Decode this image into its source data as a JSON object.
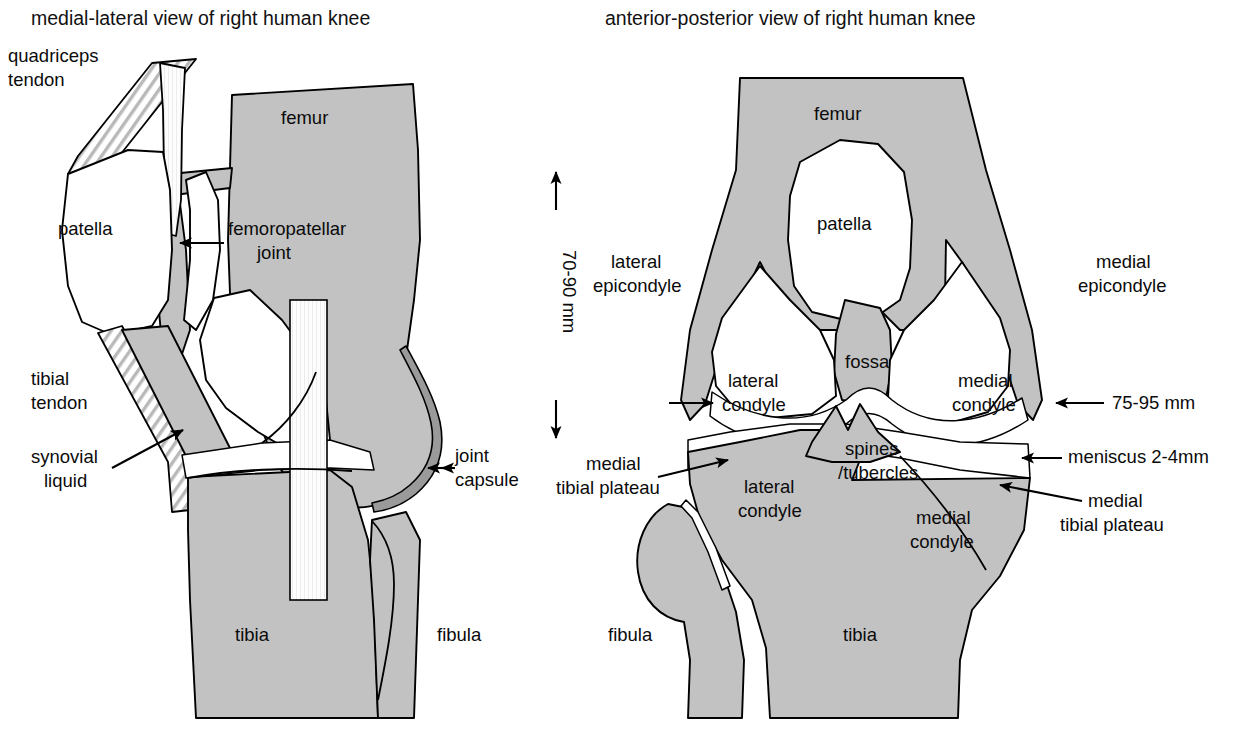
{
  "figure": {
    "kind": "anatomical-diagram",
    "background_color": "#ffffff",
    "bone_fill_color": "#c2c2c2",
    "outline_color": "#000000",
    "cartilage_fill_color": "#ffffff"
  },
  "left_panel": {
    "title": "medial-lateral view of right human knee",
    "labels": {
      "quadriceps_tendon": "quadriceps\ntendon",
      "quadriceps_tendon_line1": "quadriceps",
      "quadriceps_tendon_line2": "tendon",
      "patella": "patella",
      "femur": "femur",
      "femoropatellar_joint_line1": "femoropatellar",
      "femoropatellar_joint_line2": "joint",
      "tibial_tendon_line1": "tibial",
      "tibial_tendon_line2": "tendon",
      "synovial_liquid_line1": "synovial",
      "synovial_liquid_line2": "liquid",
      "joint_capsule_line1": "joint",
      "joint_capsule_line2": "capsule",
      "tibia": "tibia",
      "fibula": "fibula"
    }
  },
  "scale_bar": {
    "value": "70-90 mm",
    "orientation": "vertical",
    "arrow_up": "▲",
    "arrow_down": "▼"
  },
  "right_panel": {
    "title": "anterior-posterior view of right human knee",
    "labels": {
      "femur": "femur",
      "patella": "patella",
      "lateral_epicondyle_line1": "lateral",
      "lateral_epicondyle_line2": "epicondyle",
      "medial_epicondyle_line1": "medial",
      "medial_epicondyle_line2": "epicondyle",
      "fossa": "fossa",
      "lateral_condyle_femur_line1": "lateral",
      "lateral_condyle_femur_line2": "condyle",
      "medial_condyle_femur_line1": "medial",
      "medial_condyle_femur_line2": "condyle",
      "width_measure": "75-95 mm",
      "spines_tubercles_line1": "spines",
      "spines_tubercles_line2": "/tubercles",
      "medial_tibial_plateau_left_line1": "medial",
      "medial_tibial_plateau_left_line2": "tibial plateau",
      "meniscus": "meniscus 2-4mm",
      "medial_tibial_plateau_right_line1": "medial",
      "medial_tibial_plateau_right_line2": "tibial plateau",
      "lateral_condyle_tibia_line1": "lateral",
      "lateral_condyle_tibia_line2": "condyle",
      "medial_condyle_tibia_line1": "medial",
      "medial_condyle_tibia_line2": "condyle",
      "fibula": "fibula",
      "tibia": "tibia"
    }
  }
}
